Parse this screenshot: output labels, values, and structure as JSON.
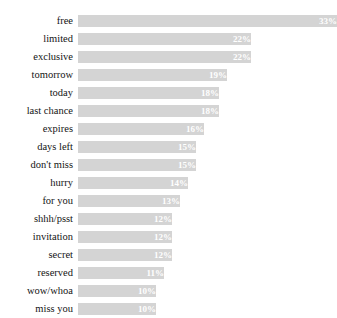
{
  "chart_data": {
    "type": "bar",
    "orientation": "horizontal",
    "title": "",
    "title_clipped": true,
    "xlabel": "",
    "ylabel": "",
    "grid": false,
    "legend": null,
    "value_suffix": "%",
    "xlim": [
      0,
      33
    ],
    "bar_color": "#d4d4d4",
    "value_label_color": "#ffffff",
    "categories": [
      "free",
      "limited",
      "exclusive",
      "tomorrow",
      "today",
      "last chance",
      "expires",
      "days left",
      "don't miss",
      "hurry",
      "for you",
      "shhh/psst",
      "invitation",
      "secret",
      "reserved",
      "wow/whoa",
      "miss you"
    ],
    "values": [
      33,
      22,
      22,
      19,
      18,
      18,
      16,
      15,
      15,
      14,
      13,
      12,
      12,
      12,
      11,
      10,
      10
    ],
    "value_labels": [
      "33%",
      "22%",
      "22%",
      "19%",
      "18%",
      "18%",
      "16%",
      "15%",
      "15%",
      "14%",
      "13%",
      "12%",
      "12%",
      "12%",
      "11%",
      "10%",
      "10%"
    ]
  }
}
